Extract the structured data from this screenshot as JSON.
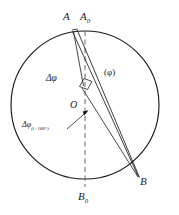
{
  "figure": {
    "type": "geometric-diagram",
    "background_color": "#ffffff",
    "stroke_color": "#1a1a1a",
    "labels": {
      "point_a": "A",
      "point_a0_main": "A",
      "point_a0_sub": "0",
      "point_b": "B",
      "point_b0_main": "B",
      "point_b0_sub": "0",
      "center_o": "O",
      "delta_phi": "Δφ",
      "phi_paren": "(φ)",
      "delta_phi_i180_main": "Δφ",
      "delta_phi_i180_sub": "(i+180°)"
    },
    "geometry": {
      "circle": {
        "cx": 85,
        "cy": 105,
        "r": 74
      },
      "points": {
        "A": {
          "x": 73,
          "y": 32
        },
        "A0": {
          "x": 85,
          "y": 31
        },
        "B": {
          "x": 138,
          "y": 176
        },
        "B0": {
          "x": 85,
          "y": 179
        },
        "O": {
          "x": 85,
          "y": 105
        }
      },
      "dashed_diameter": {
        "x1": 85,
        "y1": 31,
        "x2": 85,
        "y2": 186
      },
      "chords": [
        {
          "name": "chord-a-b-outer",
          "x1": 73,
          "y1": 32,
          "x2": 138,
          "y2": 176
        },
        {
          "name": "chord-a-b-inner",
          "x1": 76,
          "y1": 31,
          "x2": 139,
          "y2": 177
        }
      ],
      "angle_marker": {
        "name": "right-angle-marker",
        "points": "80,86 84,78 92,81 88,89"
      },
      "leader_arrow": {
        "x1": 68,
        "y1": 128,
        "x2": 88,
        "y2": 111
      }
    }
  }
}
